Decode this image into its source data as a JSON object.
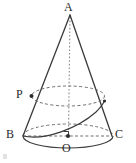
{
  "figure": {
    "type": "geometry-diagram",
    "stroke_color": "#3a3a3a",
    "dashed_color": "#6e6e6e",
    "background_color": "#ffffff",
    "labels": {
      "apex": "A",
      "base_left": "B",
      "base_right": "C",
      "base_center": "O",
      "slant_point": "P"
    },
    "points": {
      "A": {
        "x": 70,
        "y": 15
      },
      "B": {
        "x": 23,
        "y": 136
      },
      "C": {
        "x": 112,
        "y": 136
      },
      "O": {
        "x": 68,
        "y": 136
      },
      "P": {
        "x": 31.5,
        "y": 96
      },
      "Q": {
        "x": 104,
        "y": 101
      }
    },
    "base_ellipse": {
      "cx": 68,
      "cy": 136,
      "rx": 45,
      "ry": 12
    },
    "upper_ellipse": {
      "cx": 68,
      "cy": 96,
      "rx": 36.5,
      "ry": 10
    },
    "axis": {
      "from": "A",
      "to": "O",
      "style": "dotted"
    },
    "right_angle_marker": {
      "x": 68,
      "y": 136,
      "size": 5
    },
    "marks": [
      "point-dot-P",
      "point-dot-O",
      "right-angle-at-O"
    ]
  }
}
